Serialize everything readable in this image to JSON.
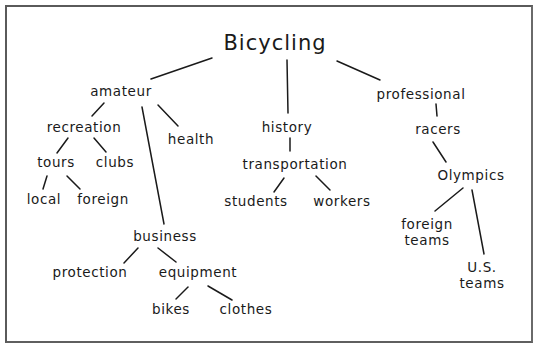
{
  "diagram": {
    "type": "concept-map",
    "root": "Bicycling",
    "nodes": {
      "bicycling": "Bicycling",
      "amateur": "amateur",
      "history": "history",
      "professional": "professional",
      "recreation": "recreation",
      "health": "health",
      "tours": "tours",
      "clubs": "clubs",
      "local": "local",
      "foreign": "foreign",
      "business": "business",
      "protection": "protection",
      "equipment": "equipment",
      "bikes": "bikes",
      "clothes": "clothes",
      "transportation": "transportation",
      "students": "students",
      "workers": "workers",
      "racers": "racers",
      "olympics": "Olympics",
      "foreign_teams_1": "foreign",
      "foreign_teams_2": "teams",
      "us_teams_1": "U.S.",
      "us_teams_2": "teams"
    },
    "edges": [
      [
        "Bicycling",
        "amateur"
      ],
      [
        "Bicycling",
        "history"
      ],
      [
        "Bicycling",
        "professional"
      ],
      [
        "amateur",
        "recreation"
      ],
      [
        "amateur",
        "health"
      ],
      [
        "amateur",
        "business"
      ],
      [
        "recreation",
        "tours"
      ],
      [
        "recreation",
        "clubs"
      ],
      [
        "tours",
        "local"
      ],
      [
        "tours",
        "foreign"
      ],
      [
        "business",
        "protection"
      ],
      [
        "business",
        "equipment"
      ],
      [
        "equipment",
        "bikes"
      ],
      [
        "equipment",
        "clothes"
      ],
      [
        "history",
        "transportation"
      ],
      [
        "transportation",
        "students"
      ],
      [
        "transportation",
        "workers"
      ],
      [
        "professional",
        "racers"
      ],
      [
        "racers",
        "Olympics"
      ],
      [
        "Olympics",
        "foreign teams"
      ],
      [
        "Olympics",
        "U.S. teams"
      ]
    ]
  }
}
